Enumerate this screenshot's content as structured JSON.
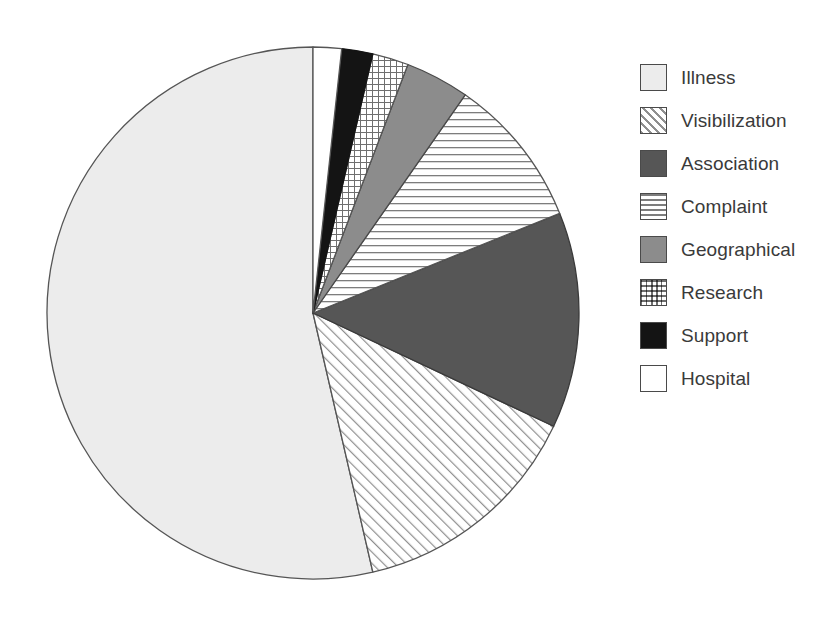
{
  "figure": {
    "background_color": "#ffffff",
    "width": 836,
    "height": 617
  },
  "chart_data": {
    "type": "pie",
    "title": "",
    "subtitle": "",
    "xlabel": "",
    "ylabel": "",
    "grid": false,
    "legend_position": "right",
    "start_angle_deg": 90,
    "direction": "counterclockwise",
    "center": {
      "x": 313,
      "y": 313
    },
    "radius": 266,
    "categories": [
      "Illness",
      "Visibilization",
      "Association",
      "Complaint",
      "Geographical",
      "Research",
      "Support",
      "Hospital"
    ],
    "values": [
      53.6,
      14.4,
      13.1,
      9.2,
      3.9,
      2.2,
      1.9,
      1.7
    ],
    "angles_deg": [
      193.0,
      51.8,
      47.2,
      33.1,
      14.0,
      7.9,
      6.8,
      6.2
    ],
    "series": [
      {
        "name": "Share of initiatives",
        "values": [
          53.6,
          14.4,
          13.1,
          9.2,
          3.9,
          2.2,
          1.9,
          1.7
        ]
      }
    ],
    "slices": [
      {
        "label": "Illness",
        "value": 53.6,
        "angle_deg": 193.0,
        "pattern": "solid",
        "fill": "#ececec",
        "edge": "#555555"
      },
      {
        "label": "Visibilization",
        "value": 14.4,
        "angle_deg": 51.8,
        "pattern": "diagonal-hatch",
        "fill": "#ffffff",
        "edge": "#555555"
      },
      {
        "label": "Association",
        "value": 13.1,
        "angle_deg": 47.2,
        "pattern": "solid",
        "fill": "#565656",
        "edge": "#3a3a3a"
      },
      {
        "label": "Complaint",
        "value": 9.2,
        "angle_deg": 33.1,
        "pattern": "horizontal-lines",
        "fill": "#ffffff",
        "edge": "#555555"
      },
      {
        "label": "Geographical",
        "value": 3.9,
        "angle_deg": 14.0,
        "pattern": "solid",
        "fill": "#8c8c8c",
        "edge": "#4a4a4a"
      },
      {
        "label": "Research",
        "value": 2.2,
        "angle_deg": 7.9,
        "pattern": "crosshatch-grid",
        "fill": "#ffffff",
        "edge": "#555555"
      },
      {
        "label": "Support",
        "value": 1.9,
        "angle_deg": 6.8,
        "pattern": "solid",
        "fill": "#141414",
        "edge": "#141414"
      },
      {
        "label": "Hospital",
        "value": 1.7,
        "angle_deg": 6.2,
        "pattern": "solid",
        "fill": "#ffffff",
        "edge": "#555555"
      }
    ]
  },
  "legend": {
    "items": [
      {
        "label": "Illness",
        "swatch": "solid",
        "color": "#ececec"
      },
      {
        "label": "Visibilization",
        "swatch": "diagonal-hatch",
        "color": "#ffffff"
      },
      {
        "label": "Association",
        "swatch": "solid",
        "color": "#565656"
      },
      {
        "label": "Complaint",
        "swatch": "horizontal-lines",
        "color": "#ffffff"
      },
      {
        "label": "Geographical",
        "swatch": "solid",
        "color": "#8c8c8c"
      },
      {
        "label": "Research",
        "swatch": "crosshatch-grid",
        "color": "#ffffff"
      },
      {
        "label": "Support",
        "swatch": "solid",
        "color": "#141414"
      },
      {
        "label": "Hospital",
        "swatch": "solid",
        "color": "#ffffff"
      }
    ]
  }
}
